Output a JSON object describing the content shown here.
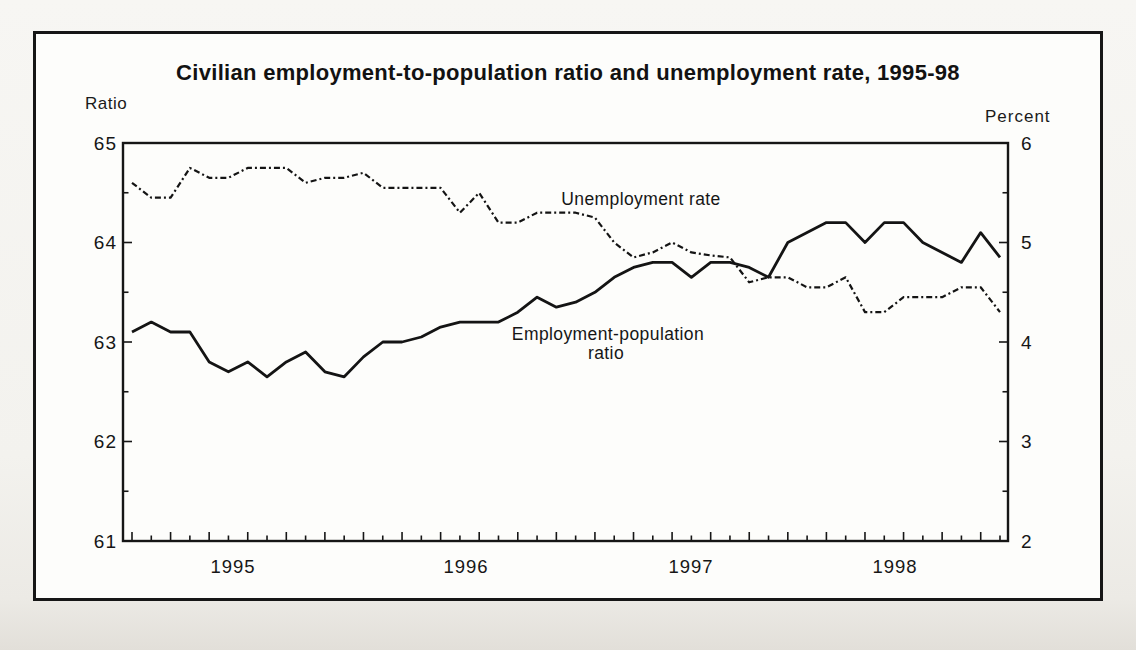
{
  "chart_data": {
    "type": "line",
    "title": "Civilian employment-to-population ratio and unemployment rate, 1995-98",
    "x": {
      "unit": "month",
      "start": "1995-01",
      "end": "1998-10",
      "points": 46
    },
    "x_tick_labels": [
      "1995",
      "1996",
      "1997",
      "1998"
    ],
    "left_axis": {
      "title": "Ratio",
      "min": 61,
      "max": 65,
      "major_ticks": [
        61,
        62,
        63,
        64,
        65
      ],
      "minor_step": 0.5
    },
    "right_axis": {
      "title": "Percent",
      "min": 2,
      "max": 6,
      "major_ticks": [
        2,
        3,
        4,
        5,
        6
      ],
      "minor_step": 0.5
    },
    "grid": false,
    "legend": "inline-labels",
    "ink_color": "#161616",
    "series": [
      {
        "name": "Employment-population ratio",
        "label_lines": [
          "Employment-population",
          "ratio"
        ],
        "axis": "left",
        "style": "solid",
        "values": [
          63.1,
          63.2,
          63.1,
          63.1,
          62.8,
          62.7,
          62.8,
          62.65,
          62.8,
          62.9,
          62.7,
          62.65,
          62.85,
          63.0,
          63.0,
          63.05,
          63.15,
          63.2,
          63.2,
          63.2,
          63.3,
          63.45,
          63.35,
          63.4,
          63.5,
          63.65,
          63.75,
          63.8,
          63.8,
          63.65,
          63.8,
          63.8,
          63.75,
          63.65,
          64.0,
          64.1,
          64.2,
          64.2,
          64.0,
          64.2,
          64.2,
          64.0,
          63.9,
          63.8,
          64.1,
          63.85
        ]
      },
      {
        "name": "Unemployment rate",
        "label_lines": [
          "Unemployment rate"
        ],
        "axis": "right",
        "style": "dash-dot",
        "values": [
          5.6,
          5.45,
          5.45,
          5.75,
          5.65,
          5.65,
          5.75,
          5.75,
          5.75,
          5.6,
          5.65,
          5.65,
          5.7,
          5.55,
          5.55,
          5.55,
          5.55,
          5.3,
          5.5,
          5.2,
          5.2,
          5.3,
          5.3,
          5.3,
          5.25,
          5.0,
          4.85,
          4.9,
          5.0,
          4.9,
          4.87,
          4.85,
          4.6,
          4.65,
          4.65,
          4.55,
          4.55,
          4.65,
          4.3,
          4.3,
          4.45,
          4.45,
          4.45,
          4.55,
          4.55,
          4.3
        ]
      }
    ]
  }
}
